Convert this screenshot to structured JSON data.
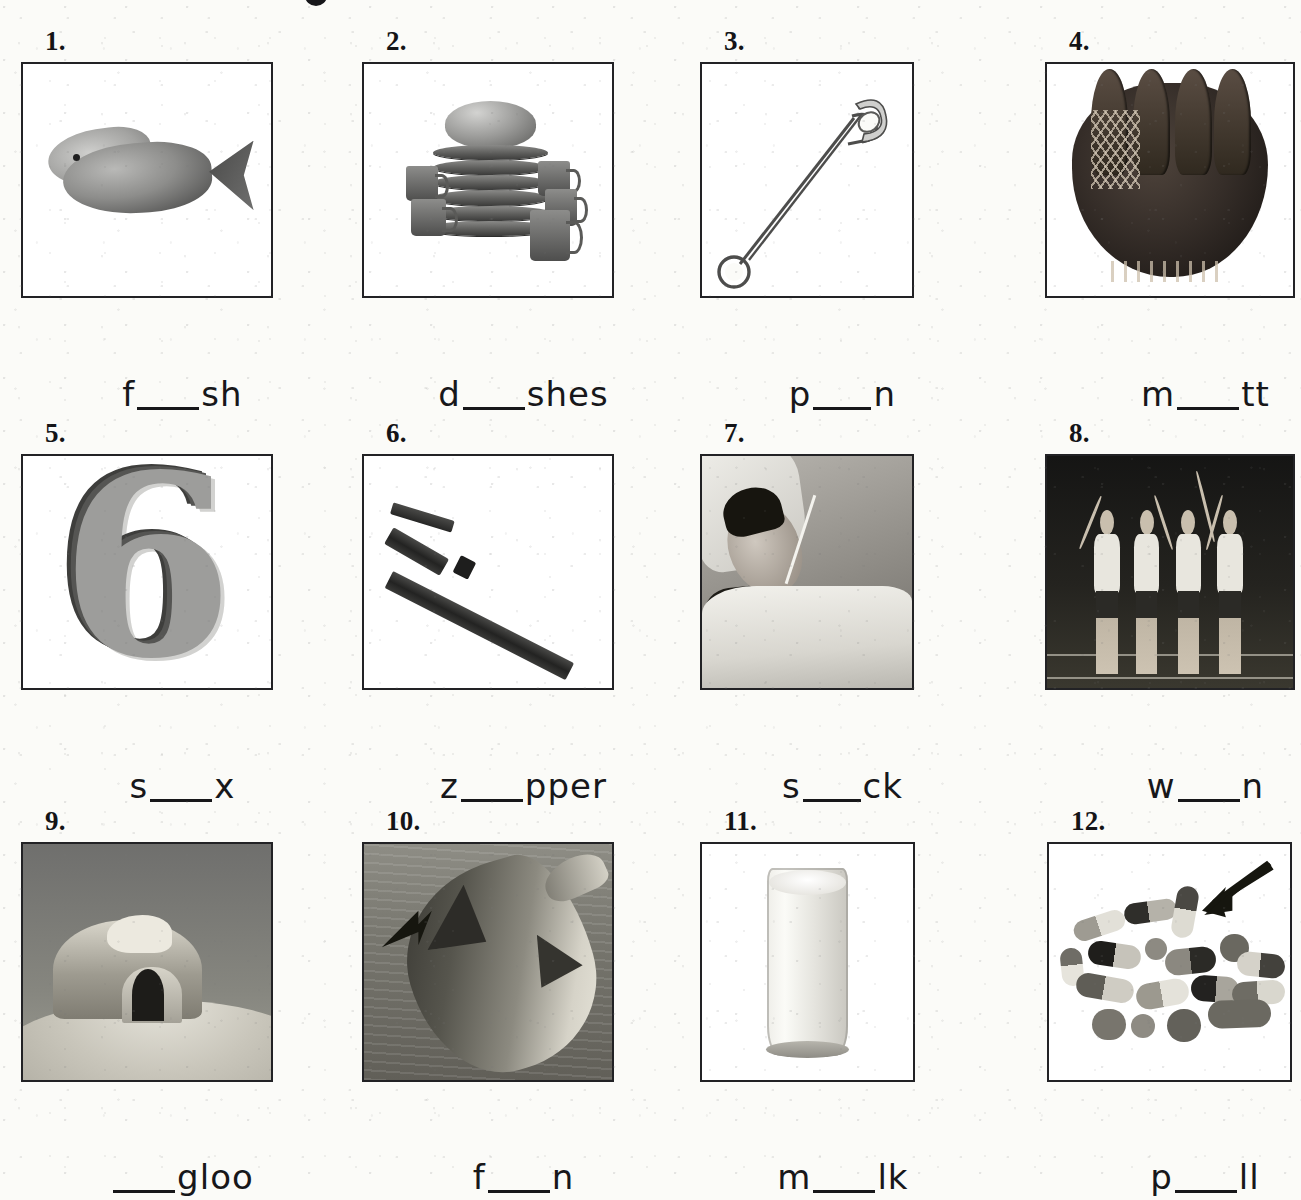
{
  "worksheet": {
    "title_partial": "",
    "columns": 4,
    "rows": 3,
    "ink_color": "#17171a",
    "paper_color": "#fbfbf8"
  },
  "items": [
    {
      "number": "1.",
      "picture": "fish",
      "word_before": "f",
      "word_blank": "_____",
      "word_after": "sh"
    },
    {
      "number": "2.",
      "picture": "dishes",
      "word_before": "d",
      "word_blank": "_____",
      "word_after": "shes"
    },
    {
      "number": "3.",
      "picture": "safety-pin",
      "word_before": "p",
      "word_blank": "_____",
      "word_after": "n"
    },
    {
      "number": "4.",
      "picture": "baseball-mitt",
      "word_before": "m",
      "word_blank": "_____",
      "word_after": "tt"
    },
    {
      "number": "5.",
      "picture": "number-six",
      "word_before": "s",
      "word_blank": "_____",
      "word_after": "x"
    },
    {
      "number": "6.",
      "picture": "zipper",
      "word_before": "z",
      "word_blank": "_____",
      "word_after": "pper"
    },
    {
      "number": "7.",
      "picture": "sick-man-in-bed",
      "word_before": "s",
      "word_blank": "_____",
      "word_after": "ck"
    },
    {
      "number": "8.",
      "picture": "runners-winning-race",
      "word_before": "w",
      "word_blank": "_____",
      "word_after": "n"
    },
    {
      "number": "9.",
      "picture": "igloo",
      "word_before": "",
      "word_blank": "_____",
      "word_after": "gloo"
    },
    {
      "number": "10.",
      "picture": "dolphin-fin",
      "word_before": "f",
      "word_blank": "_____",
      "word_after": "n"
    },
    {
      "number": "11.",
      "picture": "glass-of-milk",
      "word_before": "m",
      "word_blank": "_____",
      "word_after": "lk"
    },
    {
      "number": "12.",
      "picture": "pills",
      "word_before": "p",
      "word_blank": "_____",
      "word_after": "ll"
    }
  ]
}
